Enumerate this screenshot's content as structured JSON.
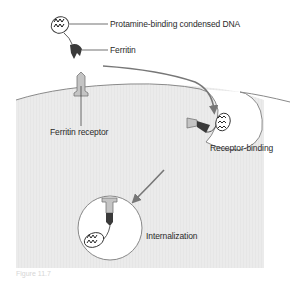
{
  "diagram": {
    "labels": {
      "dna": "Protamine-binding condensed DNA",
      "ferritin": "Ferritin",
      "receptor": "Ferritin receptor",
      "binding": "Receptor-binding",
      "internalization": "Internalization"
    },
    "caption": "Figure 11.7",
    "steps": [
      "Receptor-binding",
      "Internalization"
    ],
    "colors": {
      "cell_fill": "#e9e9e9",
      "cell_edge": "#8a8a8a",
      "ferritin": "#3a3a3a",
      "receptor": "#b5b5b5",
      "arrow": "#777777",
      "text": "#2a2a2a"
    }
  }
}
